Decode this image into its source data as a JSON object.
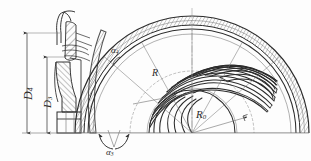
{
  "drawing": {
    "type": "engineering-drawing",
    "subject": "centrifugal-impeller",
    "description": "Meridional section (left) and half plan view of a centrifugal impeller with curved blades (right)",
    "background_color": "#fdfdfd",
    "line_color": "#2b2b2b",
    "thin_line_color": "#6f6f6f",
    "centerline_color": "#8c8c8c",
    "hatch_color": "#4a4a4a"
  },
  "labels": {
    "d4": {
      "text": "D",
      "sub": "4",
      "meaning": "outer diameter dimension"
    },
    "d3": {
      "text": "D",
      "sub": "3",
      "meaning": "inner diameter dimension"
    },
    "alpha4": {
      "text": "α",
      "sub": "4",
      "meaning": "blade outlet angle"
    },
    "alpha3": {
      "text": "α",
      "sub": "3",
      "meaning": "blade inlet angle"
    },
    "r": {
      "text": "R",
      "sub": "",
      "meaning": "blade curvature radius"
    },
    "r0": {
      "text": "R",
      "sub": "0",
      "meaning": "base circle radius"
    }
  },
  "geometry": {
    "center_x": 192,
    "center_y": 133,
    "outer_radius": 117,
    "rim_inner_radius": 108,
    "blade_outer_radius": 104,
    "blade_inner_radius": 45,
    "hub_radius": 43,
    "base_circle_radius": 62,
    "blade_count": 12,
    "baseline_y": 133
  },
  "dimension_lines": {
    "d4": {
      "x": 27,
      "y_top": 33,
      "y_bottom": 133
    },
    "d3": {
      "x": 47,
      "y_top": 57,
      "y_bottom": 133
    }
  }
}
